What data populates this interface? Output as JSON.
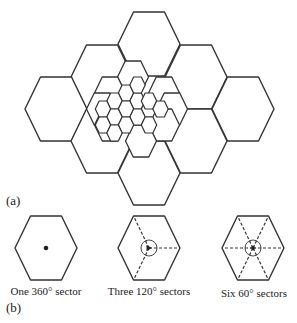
{
  "figure": {
    "stroke_color": "#333333",
    "background": "#ffffff",
    "panel_a": {
      "label": "(a)",
      "large_cells": {
        "side": 31,
        "half_height": 32,
        "centers": [
          [
            149,
            44
          ],
          [
            102,
            77
          ],
          [
            196,
            77
          ],
          [
            56,
            109
          ],
          [
            243,
            109
          ],
          [
            102,
            141
          ],
          [
            196,
            141
          ],
          [
            149,
            173
          ]
        ]
      },
      "medium_cells": {
        "side": 15.5,
        "half_height": 16,
        "centers": [
          [
            133,
            77
          ],
          [
            110,
            93
          ],
          [
            164,
            93
          ],
          [
            102,
            109
          ],
          [
            172,
            109
          ],
          [
            110,
            125
          ],
          [
            164,
            125
          ],
          [
            141,
            141
          ]
        ]
      },
      "small_cells": {
        "side": 7.7,
        "half_height": 8,
        "centers": [
          [
            126,
            93
          ],
          [
            114.5,
            101
          ],
          [
            137.5,
            101
          ],
          [
            103,
            109
          ],
          [
            126,
            109
          ],
          [
            149,
            109
          ],
          [
            114.5,
            117
          ],
          [
            137.5,
            117
          ],
          [
            103,
            125
          ],
          [
            126,
            125
          ],
          [
            149,
            101
          ],
          [
            160.5,
            109
          ],
          [
            137.5,
            85
          ],
          [
            114.5,
            133
          ],
          [
            149,
            125
          ]
        ]
      }
    },
    "panel_b": {
      "label": "(b)",
      "cells": [
        {
          "name": "omni",
          "center": [
            46,
            248
          ],
          "side": 31,
          "half_height": 32,
          "caption": "One 360° sector",
          "sector_lines": [],
          "circle": false,
          "marker": "dot"
        },
        {
          "name": "three-sector",
          "center": [
            149,
            248
          ],
          "side": 31,
          "half_height": 32,
          "caption": "Three 120° sectors",
          "sector_lines": [
            2,
            4,
            0
          ],
          "circle": true,
          "marker": "triangle"
        },
        {
          "name": "six-sector",
          "center": [
            253,
            248
          ],
          "side": 31,
          "half_height": 32,
          "caption": "Six 60° sectors",
          "sector_lines": [
            0,
            1,
            2,
            3,
            4,
            5
          ],
          "circle": true,
          "marker": "star"
        }
      ]
    }
  }
}
